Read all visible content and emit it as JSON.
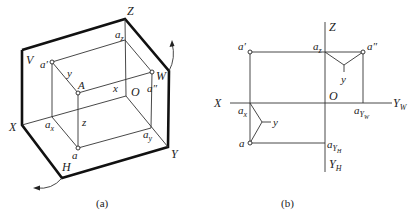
{
  "figure_a": {
    "caption": "(a)",
    "labels": {
      "Z": "Z",
      "V": "V",
      "W": "W",
      "X": "X",
      "Y": "Y",
      "H": "H",
      "O": "O",
      "A": "A",
      "a_prime": "a′",
      "a_dprime": "a″",
      "a": "a",
      "a_z": "a",
      "a_z_sub": "z",
      "a_x": "a",
      "a_x_sub": "x",
      "a_y": "a",
      "a_y_sub": "y",
      "dim_x": "x",
      "dim_y": "y",
      "dim_z": "z"
    }
  },
  "figure_b": {
    "caption": "(b)",
    "labels": {
      "Z": "Z",
      "X": "X",
      "O": "O",
      "Y_W": "Y",
      "Y_W_sub": "W",
      "Y_H": "Y",
      "Y_H_sub": "H",
      "a_prime": "a′",
      "a_dprime": "a″",
      "a": "a",
      "a_z": "a",
      "a_z_sub": "z",
      "a_x": "a",
      "a_x_sub": "x",
      "a_YW": "a",
      "a_YW_sub": "Y",
      "a_YW_subsub": "W",
      "a_YH": "a",
      "a_YH_sub": "Y",
      "a_YH_subsub": "H",
      "dim_y_top": "y",
      "dim_y_bottom": "y"
    }
  }
}
